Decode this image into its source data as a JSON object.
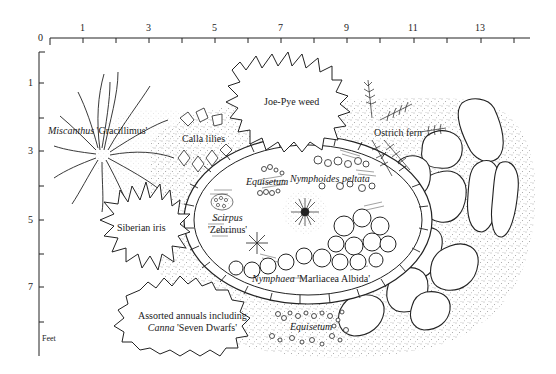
{
  "diagram": {
    "type": "garden plan",
    "units": "Feet",
    "x_axis": {
      "ticks": [
        0,
        1,
        2,
        3,
        4,
        5,
        6,
        7,
        8,
        9,
        10,
        11,
        12,
        13,
        14
      ],
      "labels": [
        "0",
        "1",
        "3",
        "5",
        "7",
        "9",
        "11",
        "13"
      ]
    },
    "y_axis": {
      "ticks": [
        0,
        1,
        2,
        3,
        4,
        5,
        6,
        7,
        8
      ],
      "labels": [
        "1",
        "3",
        "5",
        "7"
      ],
      "unit_label": "Feet"
    },
    "plants": {
      "miscanthus": {
        "genus": "Miscanthus",
        "cultivar": "'Gracillimus'"
      },
      "calla": {
        "name": "Calla lilies"
      },
      "joe_pye": {
        "name": "Joe-Pye weed"
      },
      "ostrich": {
        "name": "Ostrich fern"
      },
      "equisetum_top": {
        "genus": "Equisetum"
      },
      "nymphoides": {
        "genus": "Nymphoides peltata"
      },
      "scirpus": {
        "genus": "Scirpus",
        "cultivar": "'Zebrinus'"
      },
      "siberian": {
        "name": "Siberian iris"
      },
      "nymphaea": {
        "genus": "Nymphaea",
        "cultivar": "'Marliacea Albida'"
      },
      "annuals": {
        "line1": "Assorted annuals including",
        "genus": "Canna",
        "cultivar": "'Seven Dwarfs'"
      },
      "equisetum_bottom": {
        "genus": "Equisetum"
      }
    },
    "features": [
      "pond",
      "stone coping",
      "stepping stones",
      "gravel"
    ],
    "colors": {
      "ink": "#1a1a1a",
      "paper": "#ffffff"
    }
  }
}
